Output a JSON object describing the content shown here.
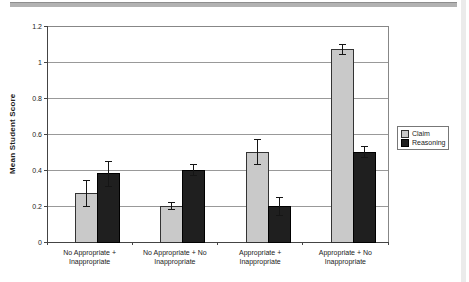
{
  "page": {
    "top_rule_color": "#b2b2b2",
    "right_strip_color": "#ebebeb",
    "background": "#ffffff"
  },
  "chart_data": {
    "type": "bar",
    "title": "",
    "xlabel": "",
    "ylabel": "Mean Student Score",
    "categories": [
      "No Appropriate + Inappropriate",
      "No Appropriate + No Inappropriate",
      "Appropriate + Inappropriate",
      "Appropriate + No Inappropriate"
    ],
    "category_lines": [
      [
        "No Appropriate +",
        "Inappropriate"
      ],
      [
        "No Appropriate + No",
        "Inappropriate"
      ],
      [
        "Appropriate +",
        "Inappropriate"
      ],
      [
        "Appropriate + No",
        "Inappropriate"
      ]
    ],
    "series": [
      {
        "name": "Claim",
        "values": [
          0.27,
          0.2,
          0.5,
          1.07
        ],
        "errors": [
          0.07,
          0.02,
          0.07,
          0.03
        ],
        "color": "#c9c9c9",
        "border": "#333333"
      },
      {
        "name": "Reasoning",
        "values": [
          0.38,
          0.4,
          0.2,
          0.5
        ],
        "errors": [
          0.07,
          0.03,
          0.05,
          0.03
        ],
        "color": "#1f1f1f",
        "border": "#000000"
      }
    ],
    "ylim": [
      0,
      1.2
    ],
    "ytick_step": 0.2,
    "ytick_labels": [
      "0",
      "0.2",
      "0.4",
      "0.6",
      "0.8",
      "1",
      "1.2"
    ],
    "grid": true,
    "legend_position": "right",
    "colors": {
      "gridline": "#999999",
      "frame": "#878787",
      "axis": "#444444",
      "error_bar": "#151515",
      "plot_bg": "#ffffff"
    }
  }
}
